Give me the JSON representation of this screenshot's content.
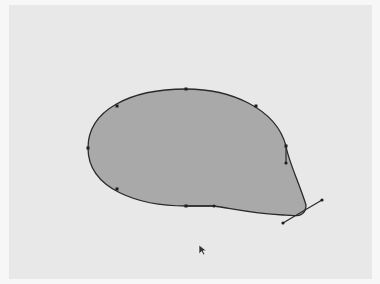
{
  "canvas": {
    "background": "#e8e8e8",
    "frame_background": "#f7f7f7"
  },
  "shape": {
    "fill": "#a9a9a9",
    "stroke": "#2a2a2a",
    "anchors": [
      {
        "name": "left",
        "x": 88,
        "y": 148
      },
      {
        "name": "upper-left",
        "x": 117,
        "y": 106
      },
      {
        "name": "top",
        "x": 186,
        "y": 89
      },
      {
        "name": "upper-right",
        "x": 256,
        "y": 106
      },
      {
        "name": "right",
        "x": 286,
        "y": 146
      },
      {
        "name": "bottom-right",
        "x": 303,
        "y": 215
      },
      {
        "name": "bottom",
        "x": 186,
        "y": 206
      },
      {
        "name": "lower-left",
        "x": 117,
        "y": 189
      }
    ],
    "handles": [
      {
        "from": [
          286,
          146
        ],
        "to": [
          286,
          163
        ]
      },
      {
        "from": [
          186,
          206
        ],
        "to": [
          214,
          206
        ]
      },
      {
        "from": [
          283,
          223
        ],
        "to": [
          322,
          200
        ]
      }
    ]
  },
  "cursor": {
    "icon": "arrow-pointer-icon",
    "x": 200,
    "y": 248
  }
}
